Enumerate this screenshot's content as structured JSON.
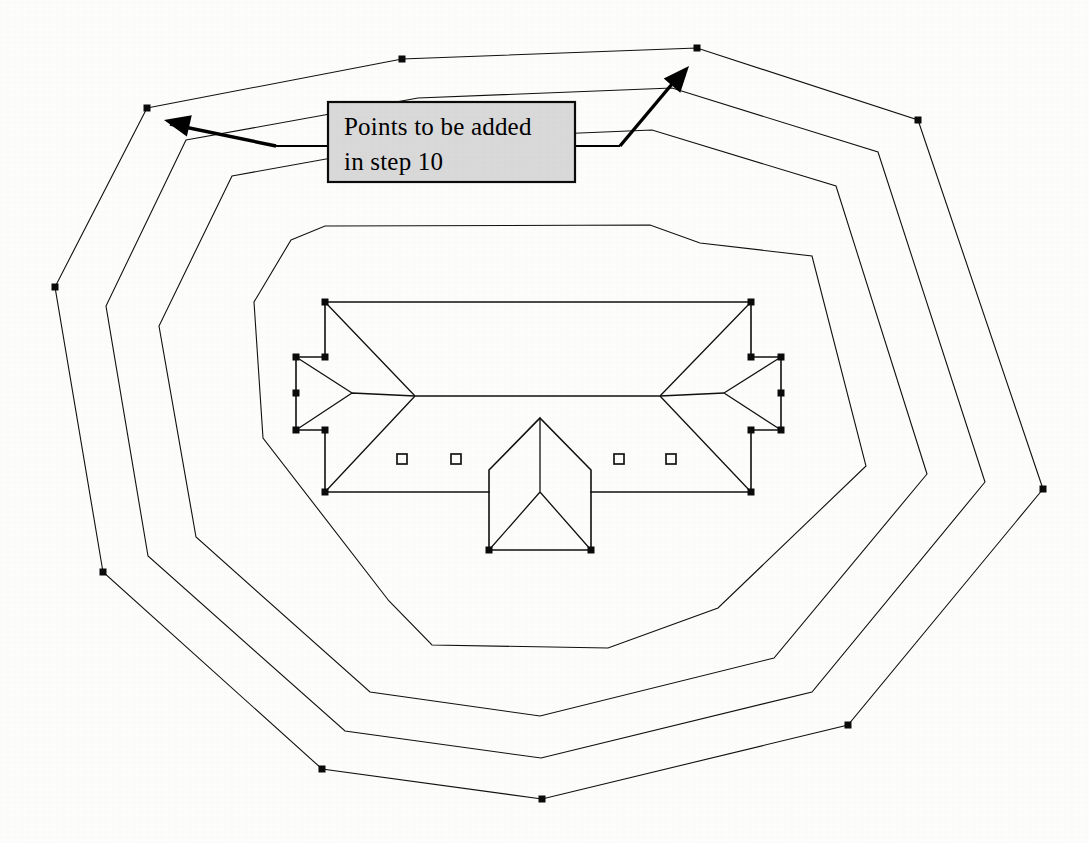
{
  "document": {
    "title": "Roof plan with offset contour polygons",
    "background_color": "#fdfdfc",
    "line_color": "#101010",
    "width": 1089,
    "height": 843
  },
  "callout": {
    "line1": "Points to be added",
    "line2": "in step 10",
    "fill_color": "#d9d9d9",
    "border_color": "#0a0a0a",
    "x": 328,
    "y": 102,
    "width": 247,
    "height": 80
  },
  "annotations": {
    "arrow_left": {
      "name": "arrow-to-left-vertex",
      "target_x": 147,
      "target_y": 108,
      "from_x": 328,
      "from_y": 146
    },
    "arrow_right": {
      "name": "arrow-to-right-vertex",
      "target_x": 694,
      "target_y": 50,
      "from_x": 575,
      "from_y": 146
    }
  },
  "contours": {
    "outer": {
      "label": "outermost-contour",
      "has_vertex_markers": true,
      "points": [
        [
          147,
          108
        ],
        [
          402,
          59
        ],
        [
          697,
          48
        ],
        [
          918,
          120
        ],
        [
          1043,
          489
        ],
        [
          848,
          725
        ],
        [
          542,
          799
        ],
        [
          322,
          769
        ],
        [
          103,
          572
        ],
        [
          55,
          287
        ]
      ]
    },
    "middle": {
      "label": "middle-contour",
      "has_vertex_markers": false,
      "points": [
        [
          186,
          140
        ],
        [
          418,
          98
        ],
        [
          672,
          88
        ],
        [
          878,
          152
        ],
        [
          985,
          482
        ],
        [
          812,
          692
        ],
        [
          541,
          758
        ],
        [
          345,
          731
        ],
        [
          148,
          556
        ],
        [
          106,
          306
        ]
      ]
    },
    "inner": {
      "label": "inner-contour",
      "has_vertex_markers": false,
      "points": [
        [
          232,
          176
        ],
        [
          437,
          139
        ],
        [
          652,
          130
        ],
        [
          836,
          186
        ],
        [
          927,
          474
        ],
        [
          774,
          658
        ],
        [
          540,
          716
        ],
        [
          370,
          692
        ],
        [
          196,
          537
        ],
        [
          159,
          326
        ]
      ]
    },
    "innermost": {
      "label": "innermost-contour",
      "has_vertex_markers": false,
      "points": [
        [
          291,
          240
        ],
        [
          325,
          226
        ],
        [
          650,
          225
        ],
        [
          700,
          243
        ],
        [
          812,
          256
        ],
        [
          866,
          466
        ],
        [
          718,
          608
        ],
        [
          608,
          648
        ],
        [
          432,
          645
        ],
        [
          389,
          601
        ],
        [
          263,
          438
        ],
        [
          254,
          302
        ]
      ]
    }
  },
  "building": {
    "label": "hip-roof-building-plan",
    "main_rect": {
      "x1": 325,
      "y1": 302,
      "x2": 751,
      "y2": 492
    },
    "ridge": {
      "x1": 415,
      "y1": 396,
      "x2": 660,
      "y2": 396
    },
    "left_wing": {
      "x1": 296,
      "y1": 357,
      "x2": 325,
      "y2": 430,
      "tip_x": 352,
      "tip_y": 393
    },
    "right_wing": {
      "x1": 751,
      "y1": 357,
      "x2": 781,
      "y2": 430,
      "tip_x": 724,
      "tip_y": 393
    },
    "porch": {
      "apex_x": 540,
      "apex_y": 418,
      "left_x": 489,
      "right_x": 591,
      "shoulder_y": 470,
      "base_y": 550,
      "hip_center_y": 492
    },
    "markers": [
      {
        "name": "roof-vent-marker-1",
        "x": 402,
        "y": 459
      },
      {
        "name": "roof-vent-marker-2",
        "x": 456,
        "y": 459
      },
      {
        "name": "roof-vent-marker-3",
        "x": 619,
        "y": 459
      },
      {
        "name": "roof-vent-marker-4",
        "x": 671,
        "y": 459
      }
    ],
    "vertex_markers": [
      [
        325,
        302
      ],
      [
        751,
        302
      ],
      [
        325,
        492
      ],
      [
        751,
        492
      ],
      [
        296,
        357
      ],
      [
        325,
        357
      ],
      [
        296,
        430
      ],
      [
        325,
        430
      ],
      [
        296,
        393
      ],
      [
        751,
        357
      ],
      [
        781,
        357
      ],
      [
        751,
        430
      ],
      [
        781,
        430
      ],
      [
        781,
        393
      ],
      [
        489,
        550
      ],
      [
        591,
        550
      ]
    ]
  },
  "scan_artifacts": {
    "top_left_text": "",
    "bottom_right_text": ""
  }
}
